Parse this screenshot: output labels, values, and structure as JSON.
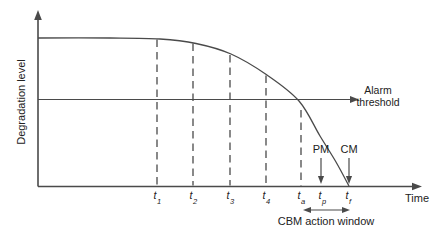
{
  "figure": {
    "y_axis_label": "Degradation level",
    "x_axis_label": "Time",
    "threshold_label": "Alarm threshold",
    "window_label": "CBM action window"
  },
  "ticks": [
    {
      "base": "t",
      "sub": "1",
      "x": 157
    },
    {
      "base": "t",
      "sub": "2",
      "x": 193
    },
    {
      "base": "t",
      "sub": "3",
      "x": 230
    },
    {
      "base": "t",
      "sub": "4",
      "x": 266
    },
    {
      "base": "t",
      "sub": "a",
      "x": 301
    },
    {
      "base": "t",
      "sub": "p",
      "x": 322
    },
    {
      "base": "t",
      "sub": "f",
      "x": 348
    }
  ],
  "events": [
    {
      "label": "PM",
      "x": 321
    },
    {
      "label": "CM",
      "x": 349
    }
  ],
  "diagram": {
    "origin_x": 38,
    "origin_y": 186.5,
    "x_axis_end": 422,
    "y_axis_top": 10,
    "threshold_y": 99.5,
    "threshold_arrow_end": 359,
    "curve_points": [
      [
        38,
        38
      ],
      [
        110,
        38
      ],
      [
        160,
        39
      ],
      [
        196,
        43.5
      ],
      [
        231,
        54
      ],
      [
        267,
        75
      ],
      [
        299,
        101
      ],
      [
        320,
        136
      ],
      [
        336,
        162
      ],
      [
        349,
        186
      ]
    ],
    "guides": [
      {
        "x": 157,
        "y_top": 39.5
      },
      {
        "x": 193,
        "y_top": 43.5
      },
      {
        "x": 230,
        "y_top": 55
      },
      {
        "x": 266,
        "y_top": 75.5
      },
      {
        "x": 301,
        "y_top": 110
      }
    ],
    "event_arrow_top": 158,
    "event_arrow_bottom": 184,
    "window_x1": 303,
    "window_x2": 350,
    "window_y": 210
  },
  "colors": {
    "line": "#4a4a4a",
    "text": "#222222",
    "background": "#ffffff"
  }
}
